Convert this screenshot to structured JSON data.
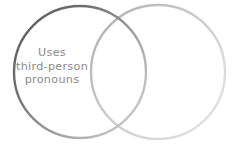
{
  "diagram": {
    "type": "venn",
    "background_color": "#ffffff",
    "width": 239,
    "height": 145,
    "set_count": 2,
    "labels": {
      "left_only": {
        "lines": [
          "Uses",
          "third-person",
          "pronouns"
        ],
        "full_text": "Uses third-person pronouns",
        "color": "#8a8a8a"
      },
      "overlap": {
        "lines": [],
        "full_text": ""
      },
      "right_only": {
        "lines": [],
        "full_text": ""
      }
    },
    "circles": [
      {
        "name": "left-circle",
        "cx": 80,
        "cy": 72,
        "r": 66,
        "stroke_dark": "#6a6a6a",
        "stroke_light": "#c4c4c4",
        "stroke_width": 2.4,
        "fill": "none"
      },
      {
        "name": "right-circle",
        "cx": 158,
        "cy": 72,
        "r": 67,
        "stroke_dark": "#bdbdbd",
        "stroke_light": "#e2e2e2",
        "stroke_width": 2.4,
        "fill": "none"
      }
    ]
  }
}
